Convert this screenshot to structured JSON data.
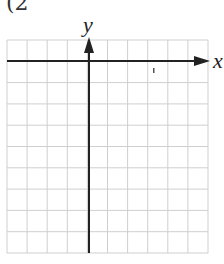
{
  "header_fragment": "(2",
  "chart_data": {
    "type": "grid",
    "title": "",
    "xlabel": "x",
    "ylabel": "y",
    "grid": true,
    "grid_columns": 10,
    "grid_rows": 10,
    "y_axis_column_index": 4,
    "x_axis_row_index": 1,
    "ticks_labeled": false
  },
  "colors": {
    "grid_line": "#cfcfcf",
    "axis": "#222222",
    "background": "#ffffff"
  },
  "geometry": {
    "left": 7,
    "right": 208,
    "top": 40,
    "bottom": 253,
    "x_axis_y": 61,
    "y_axis_x": 89
  }
}
